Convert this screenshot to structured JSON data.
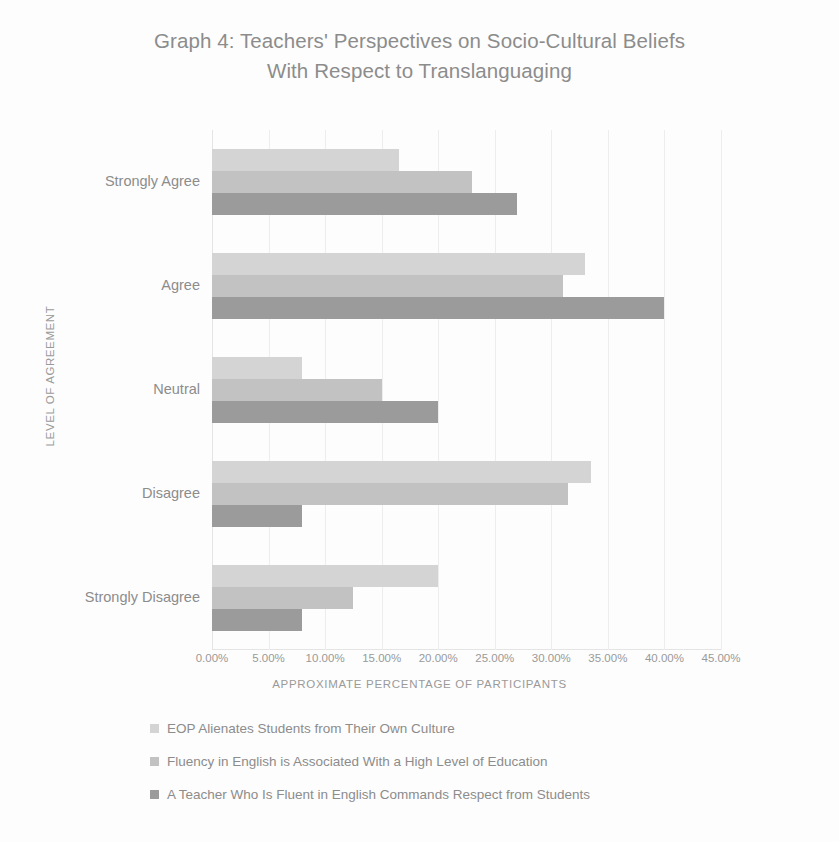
{
  "chart_data": {
    "type": "bar",
    "orientation": "horizontal",
    "title": "Graph 4: Teachers' Perspectives on Socio-Cultural Beliefs With Respect to Translanguaging",
    "title_lines": [
      "Graph 4: Teachers' Perspectives on Socio-Cultural Beliefs",
      "With Respect to Translanguaging"
    ],
    "xlabel": "APPROXIMATE PERCENTAGE OF PARTICIPANTS",
    "ylabel": "LEVEL OF AGREEMENT",
    "categories": [
      "Strongly Agree",
      "Agree",
      "Neutral",
      "Disagree",
      "Strongly Disagree"
    ],
    "xlim": [
      0,
      45
    ],
    "xticks": [
      0,
      5,
      10,
      15,
      20,
      25,
      30,
      35,
      40,
      45
    ],
    "xtick_labels": [
      "0.00%",
      "5.00%",
      "10.00%",
      "15.00%",
      "20.00%",
      "25.00%",
      "30.00%",
      "35.00%",
      "40.00%",
      "45.00%"
    ],
    "grid": true,
    "legend_position": "bottom",
    "series": [
      {
        "name": "EOP Alienates Students from Their Own Culture",
        "color": "#d4d4d4",
        "values": [
          16.5,
          33.0,
          8.0,
          33.5,
          20.0
        ]
      },
      {
        "name": "Fluency in English is Associated With a High Level of Education",
        "color": "#c2c2c2",
        "values": [
          23.0,
          31.0,
          15.0,
          31.5,
          12.5
        ]
      },
      {
        "name": "A Teacher Who Is Fluent in English Commands  Respect from Students",
        "color": "#9b9b9b",
        "values": [
          27.0,
          40.0,
          20.0,
          8.0,
          8.0
        ]
      }
    ]
  }
}
